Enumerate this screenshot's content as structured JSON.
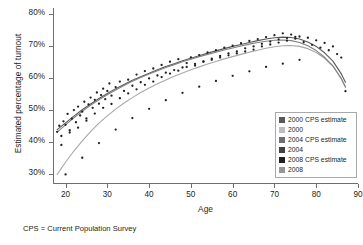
{
  "chart_data": {
    "type": "scatter",
    "title": "",
    "xlabel": "Age",
    "ylabel": "Estimated percentage of turnout",
    "xlim": [
      17,
      90
    ],
    "ylim": [
      0.27,
      0.82
    ],
    "xticks": [
      20,
      30,
      40,
      50,
      60,
      70,
      80,
      90
    ],
    "xticklabels": [
      "20",
      "30",
      "40",
      "50",
      "60",
      "70",
      "80",
      "90"
    ],
    "yticks": [
      0.3,
      0.4,
      0.5,
      0.6,
      0.7,
      0.8
    ],
    "yticklabels": [
      "30%",
      "40%",
      "50%",
      "60%",
      "70%",
      "80%"
    ],
    "grid": false,
    "legend_position": "lower-right",
    "footnote": "CPS = Current Population Survey",
    "series": [
      {
        "name": "2000 CPS estimate",
        "color": "#58595b",
        "marker": "dot",
        "x": [
          18,
          19,
          20,
          21,
          22,
          23,
          24,
          25,
          26,
          27,
          28,
          29,
          30,
          31,
          32,
          33,
          34,
          35,
          36,
          37,
          38,
          39,
          40,
          41,
          42,
          43,
          44,
          45,
          46,
          47,
          48,
          49,
          50,
          51,
          52,
          53,
          54,
          55,
          56,
          57,
          58,
          59,
          60,
          61,
          62,
          63,
          64,
          65,
          66,
          67,
          68,
          69,
          70,
          71,
          72,
          73,
          74,
          75,
          76,
          77,
          78,
          79,
          80,
          81,
          82,
          83,
          84,
          85,
          86,
          87
        ],
        "y": [
          0.435,
          0.447,
          0.441,
          0.468,
          0.462,
          0.487,
          0.497,
          0.505,
          0.516,
          0.523,
          0.519,
          0.541,
          0.548,
          0.544,
          0.561,
          0.57,
          0.566,
          0.583,
          0.589,
          0.596,
          0.591,
          0.608,
          0.604,
          0.616,
          0.612,
          0.623,
          0.634,
          0.629,
          0.641,
          0.648,
          0.643,
          0.655,
          0.651,
          0.662,
          0.669,
          0.664,
          0.676,
          0.672,
          0.683,
          0.69,
          0.685,
          0.697,
          0.693,
          0.704,
          0.7,
          0.711,
          0.718,
          0.713,
          0.72,
          0.726,
          0.722,
          0.733,
          0.729,
          0.735,
          0.731,
          0.726,
          0.722,
          0.717,
          0.712,
          0.704,
          0.696,
          0.688,
          0.676,
          0.665,
          0.652,
          0.636,
          0.618,
          0.598,
          0.577,
          0.556
        ]
      },
      {
        "name": "2000",
        "color": "#a7a9ac",
        "marker": "dot",
        "x": [
          18,
          19,
          20,
          21,
          22,
          23,
          24,
          25,
          26,
          27,
          28,
          29,
          30,
          31,
          32,
          33,
          34,
          35,
          36,
          37,
          38,
          39,
          40,
          41,
          42,
          43,
          44,
          45,
          46,
          47,
          48,
          49,
          50,
          51,
          52,
          53,
          54,
          55,
          56,
          57,
          58,
          59,
          60,
          61,
          62,
          63,
          64,
          65,
          66,
          67,
          68,
          69,
          70,
          71,
          72,
          73,
          74,
          75,
          76,
          77,
          78,
          79,
          80,
          81,
          82,
          83,
          84,
          85,
          86,
          87
        ],
        "y": [
          0.297,
          0.318,
          0.337,
          0.355,
          0.372,
          0.389,
          0.404,
          0.419,
          0.432,
          0.445,
          0.457,
          0.469,
          0.48,
          0.491,
          0.501,
          0.511,
          0.52,
          0.529,
          0.538,
          0.546,
          0.554,
          0.562,
          0.569,
          0.577,
          0.584,
          0.591,
          0.597,
          0.604,
          0.61,
          0.616,
          0.622,
          0.628,
          0.634,
          0.639,
          0.645,
          0.65,
          0.655,
          0.66,
          0.665,
          0.67,
          0.675,
          0.68,
          0.684,
          0.689,
          0.693,
          0.697,
          0.701,
          0.705,
          0.709,
          0.712,
          0.715,
          0.718,
          0.72,
          0.721,
          0.721,
          0.72,
          0.718,
          0.715,
          0.71,
          0.704,
          0.696,
          0.687,
          0.676,
          0.664,
          0.65,
          0.634,
          0.616,
          0.597,
          0.576,
          0.554
        ]
      },
      {
        "name": "2004 CPS estimate",
        "color": "#414042",
        "marker": "dot",
        "x": [
          18,
          20,
          22,
          24,
          26,
          28,
          30,
          32,
          34,
          36,
          38,
          40,
          42,
          44,
          46,
          48,
          50,
          52,
          54,
          56,
          58,
          60,
          62,
          64,
          66,
          68,
          70,
          72,
          74,
          76,
          78,
          80,
          82,
          84,
          86,
          87
        ],
        "y": [
          0.44,
          0.455,
          0.478,
          0.502,
          0.522,
          0.533,
          0.552,
          0.568,
          0.576,
          0.594,
          0.597,
          0.61,
          0.618,
          0.637,
          0.645,
          0.648,
          0.657,
          0.67,
          0.678,
          0.686,
          0.69,
          0.698,
          0.706,
          0.716,
          0.722,
          0.729,
          0.735,
          0.733,
          0.727,
          0.715,
          0.7,
          0.68,
          0.657,
          0.63,
          0.586,
          0.56
        ]
      },
      {
        "name": "2004",
        "color": "#6d6e71",
        "marker": "dot",
        "x": [
          18,
          20,
          22,
          24,
          26,
          28,
          30,
          32,
          34,
          36,
          38,
          40,
          42,
          44,
          46,
          48,
          50,
          52,
          54,
          56,
          58,
          60,
          62,
          64,
          66,
          68,
          70,
          72,
          74,
          76,
          78,
          80,
          82,
          84,
          86,
          87
        ],
        "y": [
          0.43,
          0.45,
          0.47,
          0.495,
          0.513,
          0.53,
          0.546,
          0.561,
          0.574,
          0.586,
          0.598,
          0.608,
          0.618,
          0.628,
          0.637,
          0.645,
          0.653,
          0.661,
          0.668,
          0.675,
          0.682,
          0.688,
          0.695,
          0.701,
          0.707,
          0.712,
          0.716,
          0.717,
          0.714,
          0.706,
          0.693,
          0.675,
          0.652,
          0.625,
          0.585,
          0.558
        ]
      },
      {
        "name": "2008 CPS estimate",
        "color": "#231f20",
        "marker": "dot",
        "x": [
          18,
          20,
          22,
          24,
          26,
          28,
          30,
          32,
          34,
          36,
          38,
          40,
          42,
          44,
          46,
          48,
          50,
          52,
          54,
          56,
          58,
          60,
          62,
          64,
          66,
          68,
          70,
          72,
          74,
          76,
          78,
          80,
          82,
          84,
          86,
          87
        ],
        "y": [
          0.455,
          0.472,
          0.494,
          0.516,
          0.534,
          0.55,
          0.565,
          0.58,
          0.592,
          0.604,
          0.614,
          0.624,
          0.634,
          0.644,
          0.652,
          0.66,
          0.668,
          0.676,
          0.683,
          0.69,
          0.697,
          0.703,
          0.71,
          0.716,
          0.721,
          0.726,
          0.73,
          0.73,
          0.726,
          0.717,
          0.703,
          0.684,
          0.66,
          0.632,
          0.59,
          0.562
        ]
      },
      {
        "name": "2008",
        "color": "#939598",
        "marker": "dot",
        "x": [
          18,
          20,
          22,
          24,
          26,
          28,
          30,
          32,
          34,
          36,
          38,
          40,
          42,
          44,
          46,
          48,
          50,
          52,
          54,
          56,
          58,
          60,
          62,
          64,
          66,
          68,
          70,
          72,
          74,
          76,
          78,
          80,
          82,
          84,
          86,
          87
        ],
        "y": [
          0.31,
          0.345,
          0.378,
          0.408,
          0.434,
          0.458,
          0.479,
          0.498,
          0.515,
          0.53,
          0.544,
          0.557,
          0.569,
          0.58,
          0.59,
          0.6,
          0.609,
          0.617,
          0.625,
          0.633,
          0.64,
          0.647,
          0.654,
          0.661,
          0.667,
          0.673,
          0.678,
          0.681,
          0.681,
          0.677,
          0.669,
          0.656,
          0.638,
          0.614,
          0.578,
          0.553
        ]
      }
    ],
    "fitted_curves": [
      {
        "name": "2000 CPS estimate fit",
        "color": "#58595b",
        "width": 1.1,
        "x": [
          18,
          20,
          22,
          24,
          26,
          28,
          30,
          32,
          34,
          36,
          38,
          40,
          42,
          44,
          46,
          48,
          50,
          52,
          54,
          56,
          58,
          60,
          62,
          64,
          66,
          68,
          70,
          72,
          74,
          76,
          78,
          80,
          82,
          84,
          86,
          87
        ],
        "y": [
          0.44,
          0.461,
          0.482,
          0.502,
          0.52,
          0.537,
          0.553,
          0.568,
          0.581,
          0.594,
          0.605,
          0.616,
          0.627,
          0.637,
          0.646,
          0.655,
          0.663,
          0.671,
          0.679,
          0.686,
          0.693,
          0.7,
          0.706,
          0.712,
          0.718,
          0.723,
          0.727,
          0.729,
          0.728,
          0.723,
          0.714,
          0.7,
          0.68,
          0.654,
          0.614,
          0.588
        ]
      },
      {
        "name": "2000 fit",
        "color": "#a7a9ac",
        "width": 1.1,
        "x": [
          18,
          20,
          22,
          24,
          26,
          28,
          30,
          32,
          34,
          36,
          38,
          40,
          42,
          44,
          46,
          48,
          50,
          52,
          54,
          56,
          58,
          60,
          62,
          64,
          66,
          68,
          70,
          72,
          74,
          76,
          78,
          80,
          82,
          84,
          86,
          87
        ],
        "y": [
          0.3,
          0.338,
          0.373,
          0.405,
          0.434,
          0.46,
          0.483,
          0.504,
          0.523,
          0.54,
          0.556,
          0.57,
          0.583,
          0.595,
          0.607,
          0.617,
          0.627,
          0.636,
          0.645,
          0.653,
          0.661,
          0.668,
          0.675,
          0.682,
          0.688,
          0.694,
          0.699,
          0.702,
          0.703,
          0.7,
          0.693,
          0.681,
          0.663,
          0.638,
          0.6,
          0.575
        ]
      },
      {
        "name": "2008 fit",
        "color": "#808285",
        "width": 1.1,
        "x": [
          18,
          20,
          22,
          24,
          26,
          28,
          30,
          32,
          34,
          36,
          38,
          40,
          42,
          44,
          46,
          48,
          50,
          52,
          54,
          56,
          58,
          60,
          62,
          64,
          66,
          68,
          70,
          72,
          74,
          76,
          78,
          80,
          82,
          84,
          86,
          87
        ],
        "y": [
          0.432,
          0.455,
          0.477,
          0.497,
          0.516,
          0.533,
          0.549,
          0.564,
          0.578,
          0.591,
          0.603,
          0.614,
          0.624,
          0.634,
          0.643,
          0.652,
          0.66,
          0.668,
          0.675,
          0.682,
          0.689,
          0.695,
          0.701,
          0.707,
          0.712,
          0.716,
          0.719,
          0.72,
          0.718,
          0.712,
          0.702,
          0.687,
          0.666,
          0.639,
          0.599,
          0.572
        ]
      }
    ],
    "scatter_points": {
      "color": "#231f20",
      "x": [
        18,
        18.5,
        19,
        19.5,
        20,
        20.5,
        21,
        21.5,
        22,
        22.5,
        23,
        23.5,
        24,
        24.5,
        25,
        25.5,
        26,
        26.5,
        27,
        27.5,
        28,
        28.5,
        29,
        29.5,
        30,
        30.5,
        31,
        32,
        33,
        34,
        35,
        36,
        37,
        38,
        39,
        40,
        41,
        42,
        43,
        44,
        45,
        46,
        47,
        48,
        49,
        50,
        51,
        52,
        53,
        54,
        55,
        56,
        57,
        58,
        59,
        60,
        61,
        62,
        63,
        64,
        65,
        66,
        67,
        68,
        69,
        70,
        71,
        72,
        73,
        74,
        75,
        76,
        77,
        78,
        79,
        80,
        81,
        82,
        83,
        84,
        85,
        86,
        87,
        19,
        21,
        23,
        25,
        27,
        29,
        31,
        33,
        35,
        37,
        39,
        41,
        43,
        45,
        47,
        49,
        51,
        53,
        55,
        57,
        59,
        61,
        63,
        65,
        67,
        69,
        71,
        73,
        75,
        20,
        24,
        28,
        32,
        36,
        40,
        44,
        48,
        52,
        56,
        60,
        64,
        68,
        72,
        76
      ],
      "y": [
        0.433,
        0.452,
        0.42,
        0.466,
        0.455,
        0.489,
        0.438,
        0.474,
        0.501,
        0.463,
        0.512,
        0.484,
        0.496,
        0.527,
        0.475,
        0.519,
        0.54,
        0.508,
        0.533,
        0.556,
        0.521,
        0.548,
        0.568,
        0.535,
        0.561,
        0.584,
        0.546,
        0.573,
        0.59,
        0.561,
        0.596,
        0.577,
        0.612,
        0.588,
        0.623,
        0.6,
        0.631,
        0.609,
        0.642,
        0.618,
        0.652,
        0.626,
        0.66,
        0.634,
        0.648,
        0.666,
        0.64,
        0.673,
        0.652,
        0.681,
        0.658,
        0.688,
        0.665,
        0.696,
        0.672,
        0.702,
        0.678,
        0.71,
        0.684,
        0.717,
        0.69,
        0.723,
        0.7,
        0.729,
        0.706,
        0.735,
        0.712,
        0.741,
        0.718,
        0.737,
        0.724,
        0.731,
        0.713,
        0.727,
        0.705,
        0.719,
        0.696,
        0.711,
        0.688,
        0.7,
        0.676,
        0.665,
        0.56,
        0.392,
        0.431,
        0.446,
        0.468,
        0.49,
        0.508,
        0.52,
        0.538,
        0.553,
        0.566,
        0.58,
        0.59,
        0.604,
        0.615,
        0.624,
        0.636,
        0.645,
        0.653,
        0.662,
        0.67,
        0.678,
        0.684,
        0.694,
        0.7,
        0.708,
        0.715,
        0.722,
        0.726,
        0.73,
        0.3,
        0.352,
        0.398,
        0.44,
        0.476,
        0.505,
        0.532,
        0.555,
        0.574,
        0.592,
        0.608,
        0.622,
        0.636,
        0.646,
        0.658
      ]
    }
  },
  "axes": {
    "y_title": "Estimated percentage of turnout",
    "x_title": "Age"
  },
  "legend": {
    "items": [
      {
        "label": "2000 CPS estimate",
        "color": "#58595b"
      },
      {
        "label": "2000",
        "color": "#bcbec0"
      },
      {
        "label": "2004 CPS estimate",
        "color": "#6d6e71"
      },
      {
        "label": "2004",
        "color": "#414042"
      },
      {
        "label": "2008 CPS estimate",
        "color": "#231f20"
      },
      {
        "label": "2008",
        "color": "#939598"
      }
    ]
  },
  "footnote": {
    "text": "CPS = Current Population Survey"
  }
}
